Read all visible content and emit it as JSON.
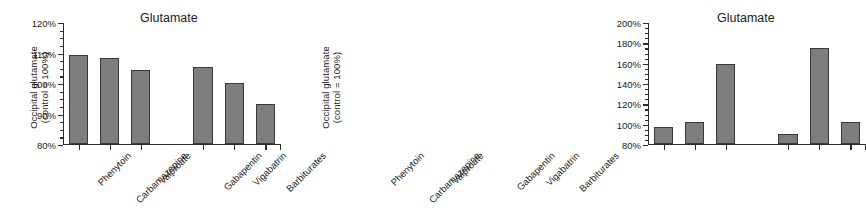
{
  "chart_data": [
    {
      "type": "bar",
      "title": "Glutamate",
      "xlabel": "",
      "ylabel": "Occipital glutamate (control = 100%)",
      "ylabel_line1": "Occipital glutamate",
      "ylabel_line2": "(control = 100%)",
      "ylim": [
        80,
        120
      ],
      "ytick_labels": [
        "120%",
        "110%",
        "100%",
        "90%",
        "80%"
      ],
      "ytick_values": [
        120,
        110,
        100,
        90,
        80
      ],
      "minor_tick_step": 2.5,
      "grid": false,
      "legend": "none",
      "categories": [
        "Phenytoin",
        "Carbamazepine",
        "Valproate",
        "Gabapentin",
        "Vigabatrin",
        "Barbiturates"
      ],
      "values": [
        109,
        108,
        104,
        105,
        100,
        93
      ],
      "group_gap_after_index": 2
    },
    {
      "type": "bar",
      "title": "Glutamate",
      "xlabel": "",
      "ylabel": "Occipital glutamate (control = 100%)",
      "ylabel_line1": "Occipital glutamate",
      "ylabel_line2": "(control = 100%)",
      "ylim": [
        80,
        200
      ],
      "ytick_labels": [
        "200%",
        "180%",
        "160%",
        "140%",
        "120%",
        "100%",
        "80%"
      ],
      "ytick_values": [
        200,
        180,
        160,
        140,
        120,
        100,
        80
      ],
      "minor_tick_step": 5,
      "grid": false,
      "legend": "none",
      "categories": [
        "Phenytoin",
        "Carbamazepine",
        "Valproate",
        "Gabapentin",
        "Vigabatrin",
        "Barbiturates"
      ],
      "values": [
        96,
        101,
        158,
        89,
        174,
        101
      ],
      "group_gap_after_index": 2
    }
  ],
  "style": {
    "bar_fill": "#7d7d7d",
    "bar_stroke": "#3a3a3a",
    "axis_color": "#2b2b2b",
    "background": "#ffffff",
    "text_color": "#1a1a1a"
  }
}
